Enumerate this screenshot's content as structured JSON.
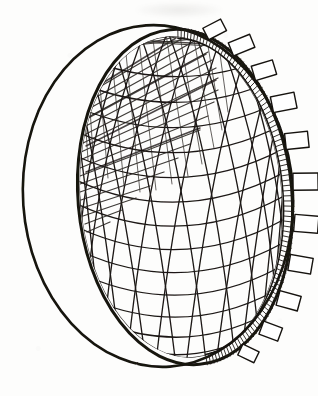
{
  "figure": {
    "caption": "",
    "medium": "pen-and-ink hand sketch on paper",
    "background_color": "#fdfdfc",
    "ink_color": "#16130f",
    "shading_color": "#2a2622",
    "paper_tone": "#fdfdfc"
  },
  "geometry": {
    "canvas": {
      "width": 318,
      "height": 396
    },
    "outer_sphere": {
      "name": "outer sphere silhouette",
      "cx": 158,
      "cy": 196,
      "rx": 135,
      "ry": 171,
      "rotation_deg": -4,
      "stroke_width": 2.6,
      "description": "large outer circle representing the full sphere outline"
    },
    "rim_ellipse": {
      "name": "dome rim opening",
      "cx": 185,
      "cy": 197,
      "rx": 107,
      "ry": 168,
      "rotation_deg": -5,
      "stroke_width": 3.0,
      "description": "inner ellipse: the open mouth of the hemispherical shell"
    },
    "inner_shell_ellipse": {
      "name": "inner shell surface edge",
      "cx": 181,
      "cy": 197,
      "rx": 101,
      "ry": 161,
      "rotation_deg": -5,
      "stroke_width": 1.1
    }
  },
  "lattice": {
    "name": "geodesic spiral lattice",
    "type": "two-family crossing spiral grid over latitude rings",
    "latitude_ring_count": 13,
    "spiral_cw_count": 11,
    "spiral_ccw_count": 11,
    "stroke_width": 1.35,
    "stroke_color": "#1b1714",
    "notes": "Horizontal latitude arcs sag downward across the concave interior; two mirrored families of diagonal spirals cross them forming diamond cells."
  },
  "shading": {
    "name": "upper-left interior shadow",
    "type": "dense diagonal crosshatch",
    "region": "upper-left quadrant of the concave interior",
    "hatch_line_count": 46,
    "opacity": 0.9,
    "direction_deg": 32,
    "description": "Heavy overlapping hatch strokes darkening the inside upper-left of the bowl where light does not reach."
  },
  "rim_band": {
    "name": "hatched rim band",
    "description": "Ladder-like band of short transverse rungs running along the right limb of the rim, reading as the shell thickness edge.",
    "rung_count": 96,
    "stroke_width": 0.9,
    "band_width_px": 9
  },
  "rim_tabs": {
    "name": "rim flanges",
    "description": "Rectangular flange plates projecting outward from the rim band toward the outer sphere outline.",
    "count": 11,
    "stroke_width": 1.4,
    "fill": "#ffffff",
    "items": [
      {
        "label": "flange-01",
        "t_deg": -72,
        "w": 20,
        "h": 13
      },
      {
        "label": "flange-02",
        "t_deg": -58,
        "w": 23,
        "h": 14
      },
      {
        "label": "flange-03",
        "t_deg": -44,
        "w": 22,
        "h": 15
      },
      {
        "label": "flange-04",
        "t_deg": -30,
        "w": 24,
        "h": 16
      },
      {
        "label": "flange-05",
        "t_deg": -16,
        "w": 23,
        "h": 16
      },
      {
        "label": "flange-06",
        "t_deg": -2,
        "w": 25,
        "h": 17
      },
      {
        "label": "flange-07",
        "t_deg": 12,
        "w": 24,
        "h": 17
      },
      {
        "label": "flange-08",
        "t_deg": 26,
        "w": 23,
        "h": 16
      },
      {
        "label": "flange-09",
        "t_deg": 40,
        "w": 22,
        "h": 15
      },
      {
        "label": "flange-10",
        "t_deg": 54,
        "w": 20,
        "h": 14
      },
      {
        "label": "flange-11",
        "t_deg": 68,
        "w": 18,
        "h": 12
      }
    ]
  },
  "annotations": {
    "visible_text": [],
    "ghost_mark": {
      "name": "bleed-through smudge",
      "description": "faint illegible ink ghost near the top edge of the sheet",
      "x": 136,
      "y": 2,
      "w": 86,
      "h": 16
    }
  }
}
